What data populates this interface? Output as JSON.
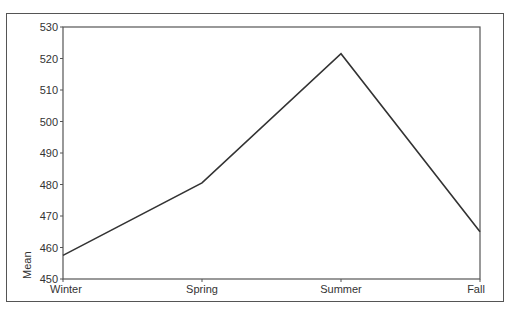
{
  "chart_data": {
    "type": "line",
    "title": "",
    "xlabel": "",
    "ylabel": "Mean",
    "categories": [
      "Winter",
      "Spring",
      "Summer",
      "Fall"
    ],
    "series": [
      {
        "name": "Mean",
        "values": [
          457.5,
          480.5,
          521.5,
          465
        ]
      }
    ],
    "ylim": [
      450,
      530
    ],
    "yticks": [
      450,
      460,
      470,
      480,
      490,
      500,
      510,
      520,
      530
    ],
    "grid": false,
    "legend": null,
    "line_color": "#333333"
  }
}
